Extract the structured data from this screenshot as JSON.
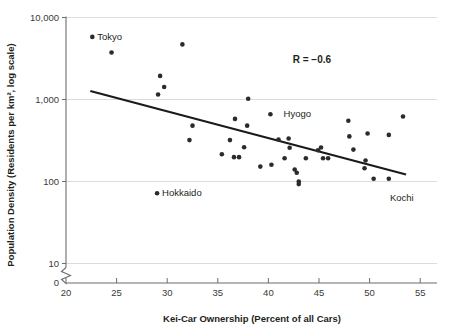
{
  "chart_data": {
    "type": "scatter",
    "title": "",
    "xlabel": "Kei-Car Ownership (Percent of all Cars)",
    "ylabel": "Population Density (Residents per km², log scale)",
    "xlim": [
      20,
      56
    ],
    "ylim": [
      10,
      10000
    ],
    "yscale": "log",
    "grid": true,
    "legend": "none",
    "x_ticks": [
      20,
      25,
      30,
      35,
      40,
      45,
      50,
      55
    ],
    "x_tick_labels": [
      "20",
      "25",
      "30",
      "35",
      "40",
      "45",
      "50",
      "55"
    ],
    "y_ticks": [
      10,
      100,
      1000,
      10000
    ],
    "y_tick_labels": [
      "10",
      "100",
      "1,000",
      "10,000"
    ],
    "y_axis_break": true,
    "y_axis_break_label": "0",
    "annotations": [
      {
        "name": "correlation",
        "text": "R = −0.6",
        "x": 44.3,
        "y": 2750
      }
    ],
    "trendline": {
      "type": "linear-on-log-y",
      "x_start": 22.4,
      "y_start": 1270,
      "x_end": 53.6,
      "y_end": 122
    },
    "point_labels": [
      {
        "label": "Tokyo",
        "x": 22.6,
        "y": 5800
      },
      {
        "label": "Hyogo",
        "x": 41.0,
        "y": 660
      },
      {
        "label": "Hokkaido",
        "x": 29.0,
        "y": 72
      },
      {
        "label": "Kochi",
        "x": 52.8,
        "y": 82
      }
    ],
    "points": [
      {
        "x": 22.6,
        "y": 5800,
        "label": "Tokyo"
      },
      {
        "x": 24.5,
        "y": 3750,
        "label": ""
      },
      {
        "x": 31.5,
        "y": 4700,
        "label": ""
      },
      {
        "x": 29.3,
        "y": 1940,
        "label": ""
      },
      {
        "x": 29.7,
        "y": 1420,
        "label": ""
      },
      {
        "x": 29.1,
        "y": 1150,
        "label": ""
      },
      {
        "x": 38.0,
        "y": 1020,
        "label": ""
      },
      {
        "x": 40.2,
        "y": 660,
        "label": "Hyogo"
      },
      {
        "x": 36.7,
        "y": 580,
        "label": ""
      },
      {
        "x": 47.9,
        "y": 550,
        "label": ""
      },
      {
        "x": 53.3,
        "y": 620,
        "label": ""
      },
      {
        "x": 32.5,
        "y": 480,
        "label": ""
      },
      {
        "x": 37.9,
        "y": 480,
        "label": ""
      },
      {
        "x": 32.2,
        "y": 320,
        "label": ""
      },
      {
        "x": 36.2,
        "y": 320,
        "label": ""
      },
      {
        "x": 41.0,
        "y": 325,
        "label": ""
      },
      {
        "x": 42.0,
        "y": 335,
        "label": ""
      },
      {
        "x": 48.0,
        "y": 355,
        "label": ""
      },
      {
        "x": 49.8,
        "y": 385,
        "label": ""
      },
      {
        "x": 51.9,
        "y": 370,
        "label": ""
      },
      {
        "x": 37.6,
        "y": 262,
        "label": ""
      },
      {
        "x": 42.1,
        "y": 258,
        "label": ""
      },
      {
        "x": 44.9,
        "y": 240,
        "label": ""
      },
      {
        "x": 45.2,
        "y": 260,
        "label": ""
      },
      {
        "x": 48.4,
        "y": 245,
        "label": ""
      },
      {
        "x": 35.4,
        "y": 215,
        "label": ""
      },
      {
        "x": 36.6,
        "y": 198,
        "label": ""
      },
      {
        "x": 37.1,
        "y": 198,
        "label": ""
      },
      {
        "x": 41.6,
        "y": 192,
        "label": ""
      },
      {
        "x": 43.7,
        "y": 192,
        "label": ""
      },
      {
        "x": 45.4,
        "y": 192,
        "label": ""
      },
      {
        "x": 45.9,
        "y": 192,
        "label": ""
      },
      {
        "x": 49.6,
        "y": 180,
        "label": ""
      },
      {
        "x": 39.2,
        "y": 152,
        "label": ""
      },
      {
        "x": 40.3,
        "y": 160,
        "label": ""
      },
      {
        "x": 42.6,
        "y": 140,
        "label": ""
      },
      {
        "x": 42.8,
        "y": 128,
        "label": ""
      },
      {
        "x": 49.5,
        "y": 145,
        "label": ""
      },
      {
        "x": 43.0,
        "y": 100,
        "label": ""
      },
      {
        "x": 43.0,
        "y": 93,
        "label": ""
      },
      {
        "x": 50.4,
        "y": 108,
        "label": ""
      },
      {
        "x": 51.9,
        "y": 108,
        "label": ""
      },
      {
        "x": 29.0,
        "y": 72,
        "label": "Hokkaido"
      }
    ]
  }
}
